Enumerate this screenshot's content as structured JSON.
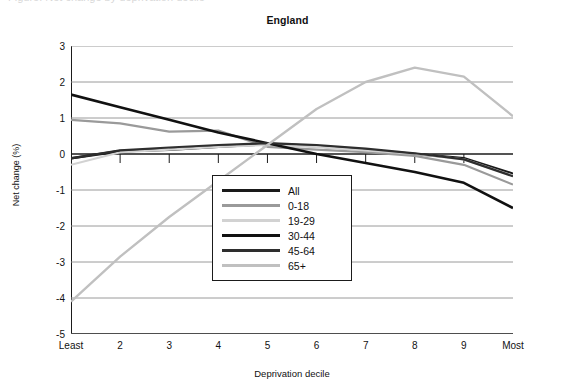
{
  "page": {
    "cut_off_header": "Figure: Net change by deprivation decile"
  },
  "chart_data": {
    "type": "line",
    "title": "England",
    "xlabel": "Deprivation decile",
    "ylabel": "Net change (%)",
    "categories": [
      "Least",
      "2",
      "3",
      "4",
      "5",
      "6",
      "7",
      "8",
      "9",
      "Most"
    ],
    "x": [
      1,
      2,
      3,
      4,
      5,
      6,
      7,
      8,
      9,
      10
    ],
    "ylim": [
      -5,
      3
    ],
    "yticks": [
      3,
      2,
      1,
      0,
      -1,
      -2,
      -3,
      -4,
      -5
    ],
    "grid": "horizontal",
    "legend_position": "center",
    "series": [
      {
        "name": "All",
        "color": "#1a1a1a",
        "width": 2.6,
        "values": [
          -0.12,
          0.08,
          0.12,
          0.2,
          0.28,
          0.22,
          0.12,
          0.0,
          -0.12,
          -0.55
        ]
      },
      {
        "name": "0-18",
        "color": "#9a9a9a",
        "width": 2.2,
        "values": [
          0.95,
          0.85,
          0.62,
          0.65,
          0.2,
          0.12,
          0.05,
          -0.05,
          -0.3,
          -0.85
        ]
      },
      {
        "name": "19-29",
        "color": "#d2d2d2",
        "width": 2.2,
        "values": [
          -0.3,
          0.05,
          0.12,
          0.2,
          0.25,
          0.2,
          0.1,
          0.0,
          -0.15,
          -0.6
        ]
      },
      {
        "name": "30-44",
        "color": "#111111",
        "width": 2.6,
        "values": [
          1.65,
          1.3,
          0.95,
          0.6,
          0.3,
          0.0,
          -0.25,
          -0.5,
          -0.8,
          -1.5
        ]
      },
      {
        "name": "45-64",
        "color": "#2e2e2e",
        "width": 2.2,
        "values": [
          -0.12,
          0.1,
          0.18,
          0.25,
          0.3,
          0.25,
          0.15,
          0.02,
          -0.15,
          -0.62
        ]
      },
      {
        "name": "65+",
        "color": "#c0c0c0",
        "width": 2.4,
        "values": [
          -4.1,
          -2.85,
          -1.75,
          -0.75,
          0.25,
          1.25,
          2.0,
          2.4,
          2.15,
          1.05
        ]
      }
    ]
  }
}
